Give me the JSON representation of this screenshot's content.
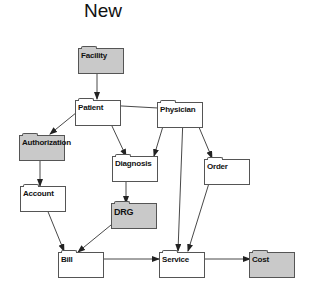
{
  "title": "New",
  "colors": {
    "shaded": "#c9c9c9",
    "plain": "#ffffff",
    "stroke": "#333333"
  },
  "nodes": [
    {
      "id": "facility",
      "label": "Facility",
      "shaded": true,
      "x": 78,
      "y": 48
    },
    {
      "id": "patient",
      "label": "Patient",
      "shaded": false,
      "x": 75,
      "y": 100
    },
    {
      "id": "physician",
      "label": "Physician",
      "shaded": false,
      "x": 157,
      "y": 102
    },
    {
      "id": "authorization",
      "label": "Authorization",
      "shaded": true,
      "x": 19,
      "y": 135
    },
    {
      "id": "diagnosis",
      "label": "Diagnosis",
      "shaded": false,
      "x": 112,
      "y": 156
    },
    {
      "id": "order",
      "label": "Order",
      "shaded": false,
      "x": 204,
      "y": 159
    },
    {
      "id": "account",
      "label": "Account",
      "shaded": false,
      "x": 20,
      "y": 186
    },
    {
      "id": "drg",
      "label": "DRG",
      "shaded": true,
      "x": 111,
      "y": 203
    },
    {
      "id": "bill",
      "label": "Bill",
      "shaded": false,
      "x": 58,
      "y": 252
    },
    {
      "id": "service",
      "label": "Service",
      "shaded": false,
      "x": 159,
      "y": 252
    },
    {
      "id": "cost",
      "label": "Cost",
      "shaded": true,
      "x": 249,
      "y": 252
    }
  ],
  "edges": [
    {
      "from": "Facility",
      "to": "Patient"
    },
    {
      "from": "Physician",
      "to": "Patient"
    },
    {
      "from": "Patient",
      "to": "Authorization"
    },
    {
      "from": "Patient",
      "to": "Diagnosis"
    },
    {
      "from": "Physician",
      "to": "Diagnosis"
    },
    {
      "from": "Physician",
      "to": "Order"
    },
    {
      "from": "Physician",
      "to": "Service"
    },
    {
      "from": "Authorization",
      "to": "Account"
    },
    {
      "from": "Diagnosis",
      "to": "DRG"
    },
    {
      "from": "Account",
      "to": "Bill"
    },
    {
      "from": "DRG",
      "to": "Bill"
    },
    {
      "from": "Order",
      "to": "Service"
    },
    {
      "from": "Bill",
      "to": "Service"
    },
    {
      "from": "Service",
      "to": "Cost"
    }
  ]
}
